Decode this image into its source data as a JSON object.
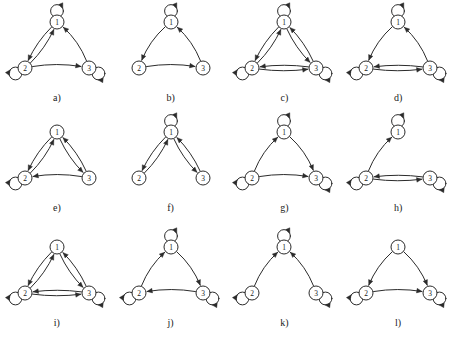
{
  "figure": {
    "node_labels": [
      "1",
      "2",
      "3"
    ],
    "stroke_color": "#2b2b2b",
    "node_fill": "#ffffff",
    "background": "#ffffff",
    "panel_count": 12
  },
  "panels": [
    {
      "caption": "a)",
      "nodes": [
        "1",
        "2",
        "3"
      ],
      "self_loops": [
        "1",
        "2",
        "3"
      ],
      "edges": [
        {
          "from": "1",
          "to": "2"
        },
        {
          "from": "2",
          "to": "1"
        },
        {
          "from": "2",
          "to": "3"
        },
        {
          "from": "3",
          "to": "1"
        }
      ]
    },
    {
      "caption": "b)",
      "nodes": [
        "1",
        "2",
        "3"
      ],
      "self_loops": [
        "1"
      ],
      "edges": [
        {
          "from": "1",
          "to": "2"
        },
        {
          "from": "2",
          "to": "3"
        },
        {
          "from": "3",
          "to": "1"
        }
      ]
    },
    {
      "caption": "c)",
      "nodes": [
        "1",
        "2",
        "3"
      ],
      "self_loops": [
        "1",
        "2",
        "3"
      ],
      "edges": [
        {
          "from": "1",
          "to": "2"
        },
        {
          "from": "2",
          "to": "1"
        },
        {
          "from": "1",
          "to": "3"
        },
        {
          "from": "3",
          "to": "1"
        },
        {
          "from": "2",
          "to": "3"
        },
        {
          "from": "3",
          "to": "2"
        }
      ]
    },
    {
      "caption": "d)",
      "nodes": [
        "1",
        "2",
        "3"
      ],
      "self_loops": [
        "1",
        "2",
        "3"
      ],
      "edges": [
        {
          "from": "1",
          "to": "2"
        },
        {
          "from": "3",
          "to": "1"
        },
        {
          "from": "2",
          "to": "3"
        },
        {
          "from": "3",
          "to": "2"
        }
      ]
    },
    {
      "caption": "e)",
      "nodes": [
        "1",
        "2",
        "3"
      ],
      "self_loops": [
        "2"
      ],
      "edges": [
        {
          "from": "1",
          "to": "2"
        },
        {
          "from": "2",
          "to": "1"
        },
        {
          "from": "1",
          "to": "3"
        },
        {
          "from": "3",
          "to": "1"
        },
        {
          "from": "3",
          "to": "2"
        }
      ]
    },
    {
      "caption": "f)",
      "nodes": [
        "1",
        "2",
        "3"
      ],
      "self_loops": [
        "1"
      ],
      "edges": [
        {
          "from": "1",
          "to": "2"
        },
        {
          "from": "2",
          "to": "1"
        },
        {
          "from": "1",
          "to": "3"
        },
        {
          "from": "3",
          "to": "1"
        }
      ]
    },
    {
      "caption": "g)",
      "nodes": [
        "1",
        "2",
        "3"
      ],
      "self_loops": [
        "1",
        "2",
        "3"
      ],
      "edges": [
        {
          "from": "2",
          "to": "1"
        },
        {
          "from": "1",
          "to": "3"
        },
        {
          "from": "2",
          "to": "3"
        }
      ]
    },
    {
      "caption": "h)",
      "nodes": [
        "1",
        "2",
        "3"
      ],
      "self_loops": [
        "1",
        "2",
        "3"
      ],
      "edges": [
        {
          "from": "2",
          "to": "1"
        },
        {
          "from": "2",
          "to": "3"
        },
        {
          "from": "3",
          "to": "2"
        }
      ]
    },
    {
      "caption": "i)",
      "nodes": [
        "1",
        "2",
        "3"
      ],
      "self_loops": [
        "2",
        "3"
      ],
      "edges": [
        {
          "from": "1",
          "to": "2"
        },
        {
          "from": "2",
          "to": "1"
        },
        {
          "from": "1",
          "to": "3"
        },
        {
          "from": "3",
          "to": "1"
        },
        {
          "from": "2",
          "to": "3"
        },
        {
          "from": "3",
          "to": "2"
        }
      ]
    },
    {
      "caption": "j)",
      "nodes": [
        "1",
        "2",
        "3"
      ],
      "self_loops": [
        "1",
        "2",
        "3"
      ],
      "edges": [
        {
          "from": "2",
          "to": "1"
        },
        {
          "from": "1",
          "to": "3"
        },
        {
          "from": "3",
          "to": "2"
        }
      ]
    },
    {
      "caption": "k)",
      "nodes": [
        "1",
        "2",
        "3"
      ],
      "self_loops": [
        "1",
        "2",
        "3"
      ],
      "edges": [
        {
          "from": "2",
          "to": "1"
        },
        {
          "from": "3",
          "to": "1"
        }
      ]
    },
    {
      "caption": "l)",
      "nodes": [
        "1",
        "2",
        "3"
      ],
      "self_loops": [
        "2",
        "3"
      ],
      "edges": [
        {
          "from": "1",
          "to": "2"
        },
        {
          "from": "1",
          "to": "3"
        },
        {
          "from": "2",
          "to": "3"
        }
      ]
    }
  ]
}
